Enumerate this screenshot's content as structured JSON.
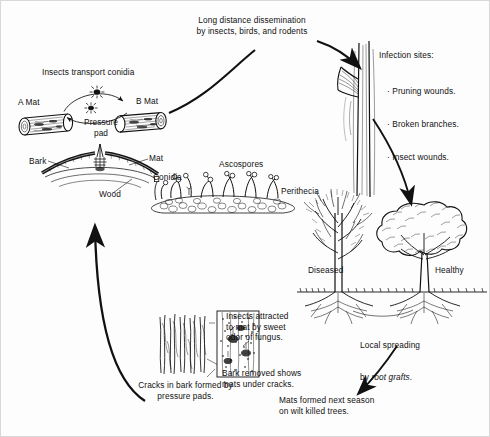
{
  "diagram": {
    "type": "disease-cycle",
    "ink_color": "#111111",
    "background_color": "#fdfdfd"
  },
  "labels": {
    "long_distance": "Long distance dissemination\nby insects, birds, and rodents",
    "insects_transport": "Insects transport conidia",
    "a_mat": "A Mat",
    "b_mat": "B Mat",
    "pressure_pad": "Pressure\npad",
    "bark": "Bark",
    "mat": "Mat",
    "wood": "Wood",
    "ascospores": "Ascospores",
    "conidia": "Conidia",
    "perithecia": "Perithecia",
    "infection_sites_heading": "Infection sites:",
    "infection_sites": [
      "· Pruning wounds.",
      "· Broken branches.",
      "· Insect wounds."
    ],
    "diseased": "Diseased",
    "healthy": "Healthy",
    "local_spreading_line1": "Local spreading",
    "local_spreading_line2_pre": "by ",
    "local_spreading_line2_em": "root grafts",
    "local_spreading_line2_post": ".",
    "cracks": "Cracks in bark formed by\npressure pads.",
    "insects_attracted": "Insects attracted\nto mat by sweet\nodor of fungus.",
    "bark_removed": "Bark removed shows\nmats under cracks.",
    "mats_formed": "Mats formed next season\non wilt killed trees."
  }
}
